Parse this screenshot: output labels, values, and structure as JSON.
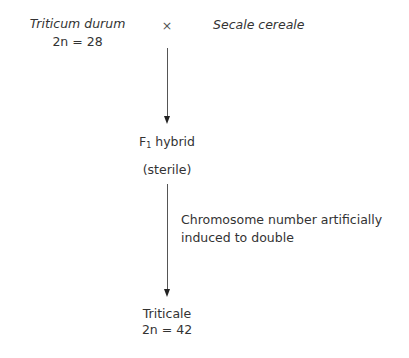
{
  "parent1": {
    "name": "Triticum durum",
    "chromosomes": "2n = 28"
  },
  "cross_symbol": "×",
  "parent2": {
    "name": "Secale cereale"
  },
  "hybrid": {
    "label_prefix": "F",
    "label_sub": "1",
    "label_suffix": " hybrid",
    "note": "(sterile)"
  },
  "step_note": {
    "line1": "Chromosome number artificially",
    "line2": "induced to double"
  },
  "result": {
    "name": "Triticale",
    "chromosomes": "2n = 42"
  }
}
